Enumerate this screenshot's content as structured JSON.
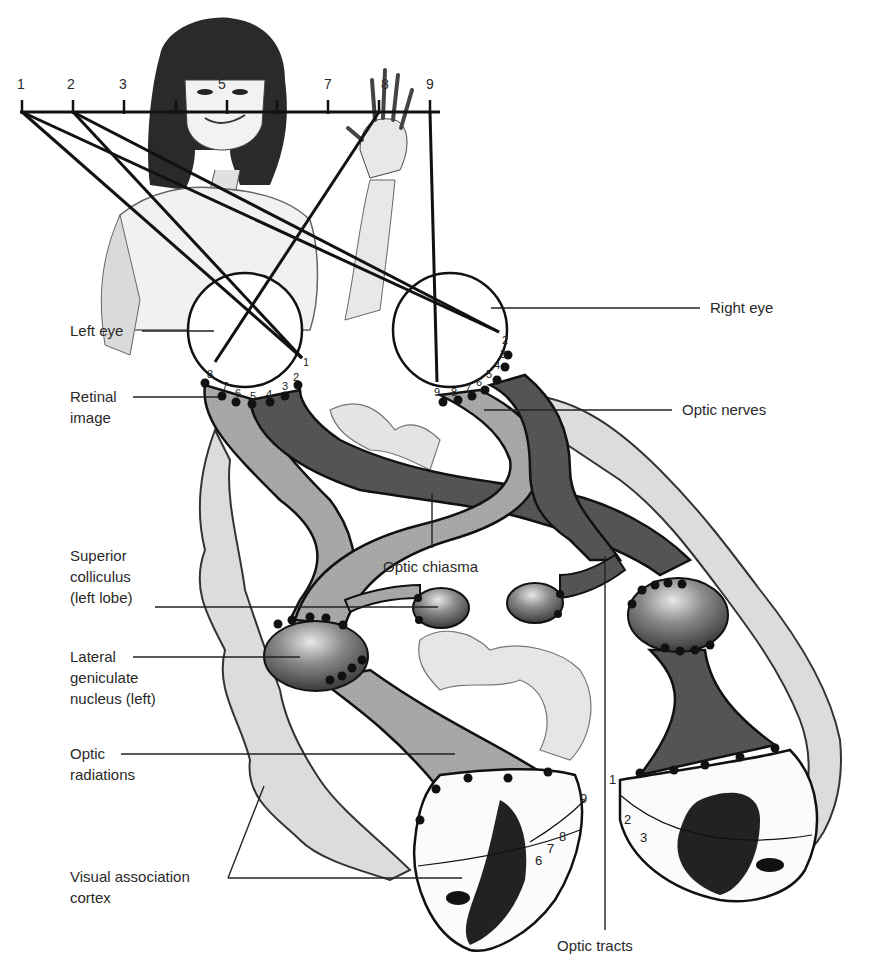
{
  "figure": {
    "ruler": {
      "numbers": [
        "1",
        "2",
        "3",
        "4",
        "5",
        "6",
        "7",
        "8",
        "9"
      ]
    },
    "labels": {
      "left_eye": "Left eye",
      "right_eye": "Right eye",
      "retinal_image": "Retinal\nimage",
      "optic_nerves": "Optic nerves",
      "optic_chiasma": "Optic chiasma",
      "superior_colliculus": "Superior\ncolliculus\n(left lobe)",
      "lgn_left": "Lateral\ngeniculate\nnucleus (left)",
      "optic_radiations": "Optic\nradiations",
      "visual_association_cortex": "Visual association\ncortex",
      "optic_tracts": "Optic tracts"
    },
    "left_retina_numbers": [
      "8",
      "7",
      "6",
      "5",
      "4",
      "3",
      "2",
      "1"
    ],
    "right_retina_numbers": [
      "9",
      "8",
      "7",
      "6",
      "5",
      "4",
      "3",
      "2"
    ],
    "left_cortex_numbers": [
      "6",
      "7",
      "8",
      "9"
    ],
    "right_cortex_numbers": [
      "1",
      "2",
      "3"
    ],
    "colors": {
      "light_pathway": "#a8a8a8",
      "dark_pathway": "#555555",
      "cortex_fold": "#d4d4d4",
      "outline": "#1a1a1a",
      "nucleus": "#707070"
    }
  }
}
